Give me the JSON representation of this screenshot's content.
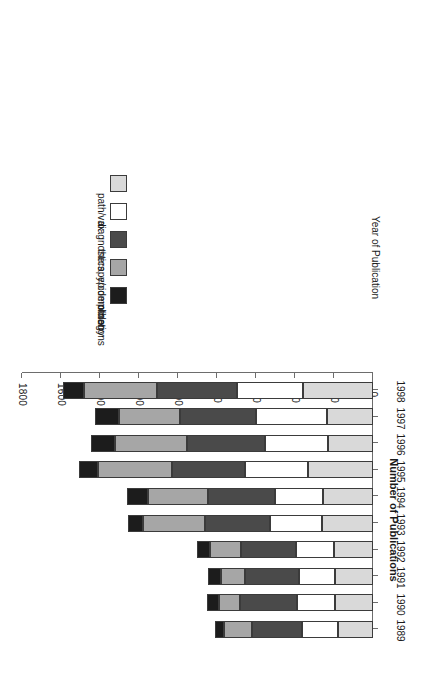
{
  "chart_data": {
    "type": "bar",
    "subtype": "stacked-horizontal-rotated",
    "title": "",
    "xlabel": "Year of Publication",
    "ylabel": "Number of Publications",
    "ylim": [
      0,
      1800
    ],
    "ytick_labels": [
      "0",
      "200",
      "400",
      "600",
      "800",
      "1000",
      "1200",
      "1400",
      "1600",
      "1800"
    ],
    "ytick_values": [
      0,
      200,
      400,
      600,
      800,
      1000,
      1200,
      1400,
      1600,
      1800
    ],
    "grid": false,
    "legend_position": "upper-left",
    "categories": [
      "1989",
      "1990",
      "1991",
      "1992",
      "1993",
      "1994",
      "1995",
      "1996",
      "1997",
      "1998"
    ],
    "series": [
      {
        "name": "path/vax",
        "color": "#d9d9d9",
        "values": [
          180,
          195,
          195,
          200,
          262,
          256,
          333,
          231,
          236,
          359
        ]
      },
      {
        "name": "diagnostics",
        "color": "#ffffff",
        "values": [
          185,
          195,
          185,
          195,
          267,
          246,
          323,
          323,
          364,
          338
        ]
      },
      {
        "name": "therapy/complications",
        "color": "#4a4a4a",
        "values": [
          256,
          292,
          277,
          282,
          333,
          344,
          374,
          400,
          390,
          410
        ]
      },
      {
        "name": "epidemiology",
        "color": "#a6a6a6",
        "values": [
          144,
          108,
          123,
          159,
          318,
          308,
          379,
          369,
          313,
          374
        ]
      },
      {
        "name": "other",
        "color": "#1c1c1c",
        "values": [
          46,
          62,
          67,
          67,
          77,
          108,
          97,
          123,
          123,
          108
        ]
      }
    ],
    "totals": [
      811,
      852,
      847,
      903,
      1257,
      1262,
      1506,
      1446,
      1426,
      1589
    ]
  },
  "legend": {
    "items": [
      {
        "label": "other",
        "color": "#1c1c1c"
      },
      {
        "label": "epidemiology",
        "color": "#a6a6a6"
      },
      {
        "label": "therapy/complications",
        "color": "#4a4a4a"
      },
      {
        "label": "diagnostics",
        "color": "#ffffff"
      },
      {
        "label": "path/vax",
        "color": "#d9d9d9"
      }
    ]
  },
  "axes": {
    "value_axis_title": "Number of Publications",
    "category_axis_title": "Year of Publication"
  },
  "style": {
    "axis_color": "#6d6d6d",
    "bar_border_color": "#3b3b3b",
    "background": "#ffffff"
  }
}
